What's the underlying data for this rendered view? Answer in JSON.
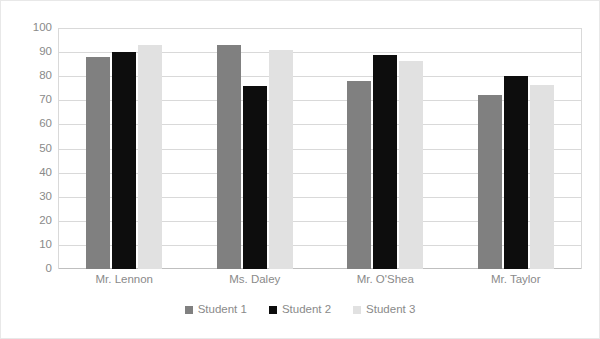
{
  "chart_data": {
    "type": "bar",
    "title": "",
    "subtitle": "",
    "xlabel": "",
    "ylabel": "",
    "ylim": [
      0,
      100
    ],
    "ytick_step": 10,
    "yticks": [
      "100",
      "90",
      "80",
      "70",
      "60",
      "50",
      "40",
      "30",
      "20",
      "10",
      "0"
    ],
    "grid": true,
    "legend_position": "bottom",
    "categories": [
      "Mr. Lennon",
      "Ms. Daley",
      "Mr. O'Shea",
      "Mr. Taylor"
    ],
    "series": [
      {
        "name": "Student 1",
        "color": "#808080",
        "values": [
          88,
          93,
          78,
          72
        ]
      },
      {
        "name": "Student 2",
        "color": "#0d0d0d",
        "values": [
          90,
          76,
          89,
          80
        ]
      },
      {
        "name": "Student 3",
        "color": "#e1e1e1",
        "values": [
          93,
          91,
          86.5,
          76.5
        ]
      }
    ]
  },
  "style": {
    "plot_background": "#ffffff",
    "gridline_color": "#d9d9d9",
    "axis_color": "#bfbfbf",
    "tick_text_color": "#8a8a8a",
    "frame_border_color": "#e8e8e8"
  }
}
